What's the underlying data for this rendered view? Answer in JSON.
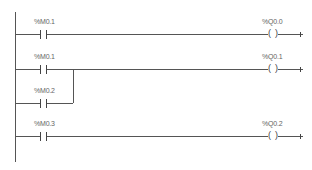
{
  "diagram": {
    "type": "ladder-logic",
    "rungs": [
      {
        "contacts": [
          {
            "label": "%M0.1"
          }
        ],
        "coil": {
          "label": "%Q0.0"
        }
      },
      {
        "contacts": [
          {
            "label": "%M0.1"
          },
          {
            "label": "%M0.2",
            "parallel": true
          }
        ],
        "coil": {
          "label": "%Q0.1"
        }
      },
      {
        "contacts": [
          {
            "label": "%M0.3"
          }
        ],
        "coil": {
          "label": "%Q0.2"
        }
      }
    ],
    "coil_glyph": {
      "left": "(",
      "right": ")"
    }
  }
}
